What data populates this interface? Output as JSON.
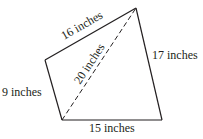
{
  "diagram": {
    "type": "quadrilateral-with-diagonal",
    "stroke_color": "#231f20",
    "background": "#ffffff",
    "vertices": {
      "top": [
        136,
        8
      ],
      "left": [
        45,
        60
      ],
      "bottom_left": [
        62,
        120
      ],
      "bottom_right": [
        162,
        120
      ]
    },
    "edges": [
      {
        "id": "top-left-edge",
        "from": "left",
        "to": "top",
        "label": "16 inches",
        "style": "solid"
      },
      {
        "id": "right-edge",
        "from": "top",
        "to": "bottom_right",
        "label": "17 inches",
        "style": "solid"
      },
      {
        "id": "bottom-edge",
        "from": "bottom_left",
        "to": "bottom_right",
        "label": "15 inches",
        "style": "solid"
      },
      {
        "id": "left-edge",
        "from": "left",
        "to": "bottom_left",
        "label": "9 inches",
        "style": "solid"
      },
      {
        "id": "diagonal",
        "from": "bottom_left",
        "to": "top",
        "label": "20 inches",
        "style": "dashed"
      }
    ]
  },
  "labels": {
    "top_left": "16 inches",
    "right": "17 inches",
    "bottom": "15 inches",
    "left": "9 inches",
    "diagonal": "20 inches"
  }
}
